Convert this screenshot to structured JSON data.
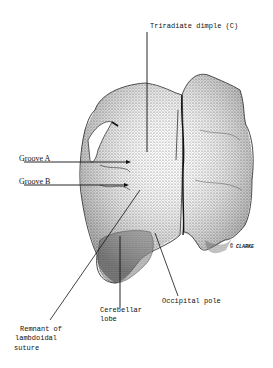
{
  "figure": {
    "copyright_mark": "© CLARKE",
    "labels": {
      "triradiate_dimple": "Triradiate dimple (C)",
      "groove_a": "Groove A",
      "groove_b": "Groove B",
      "remnant_line1": "Remnant of",
      "remnant_line2": "lambdoidal",
      "remnant_line3": "suture",
      "cerebellar_line1": "Cerebellar",
      "cerebellar_line2": "lobe",
      "occipital_pole": "Occipital pole"
    }
  }
}
